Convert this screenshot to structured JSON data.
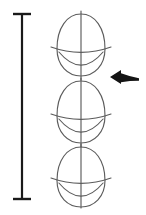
{
  "figure": {
    "title": "Egg proportion construction drawing",
    "background_color": "#ffffff",
    "width": 146,
    "height": 215
  },
  "measurement_bar": {
    "name": "height-measurement-bar",
    "color": "#1a1a1a",
    "stroke_width": 2.2,
    "cap_stroke_width": 2.4,
    "x": 22,
    "y_top": 14,
    "y_bottom": 199,
    "cap_half_width": 9,
    "label": ""
  },
  "eggs": [
    {
      "name": "egg-top",
      "index": 1,
      "center_x": 81,
      "center_y": 45,
      "radius_x": 24,
      "radius_y": 31,
      "taper": 0.78,
      "equator_y": 52,
      "equator_half_width": 30,
      "equator_bow": 5,
      "lower_arc_depth": 17,
      "axis_top": 11,
      "axis_bottom": 80,
      "color": "#5c5c5c",
      "stroke_width": 1.15
    },
    {
      "name": "egg-middle",
      "index": 2,
      "center_x": 81,
      "center_y": 112,
      "radius_x": 24,
      "radius_y": 31,
      "taper": 0.78,
      "equator_y": 119,
      "equator_half_width": 30,
      "equator_bow": 5,
      "lower_arc_depth": 17,
      "axis_top": 78,
      "axis_bottom": 147,
      "color": "#5c5c5c",
      "stroke_width": 1.15
    },
    {
      "name": "egg-bottom",
      "index": 3,
      "center_x": 81,
      "center_y": 177,
      "radius_x": 24,
      "radius_y": 30,
      "taper": 0.78,
      "equator_y": 183,
      "equator_half_width": 30,
      "equator_bow": 5,
      "lower_arc_depth": 17,
      "axis_top": 144,
      "axis_bottom": 208,
      "color": "#5c5c5c",
      "stroke_width": 1.15
    }
  ],
  "arrow": {
    "name": "pointer-arrow",
    "direction": "left",
    "color": "#141414",
    "tip_x": 110,
    "tip_y": 77,
    "tail_x": 139,
    "tail_y": 79,
    "head_length": 11,
    "head_half_height": 7,
    "tail_thickness": 3.4,
    "label": ""
  }
}
